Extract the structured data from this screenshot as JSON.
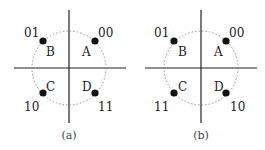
{
  "diagrams": [
    {
      "caption": "(a)",
      "points": [
        {
          "letter": "A",
          "code": "00"
        },
        {
          "letter": "B",
          "code": "01"
        },
        {
          "letter": "C",
          "code": "10"
        },
        {
          "letter": "D",
          "code": "11"
        }
      ]
    },
    {
      "caption": "(b)",
      "points": [
        {
          "letter": "A",
          "code": "00"
        },
        {
          "letter": "B",
          "code": "01"
        },
        {
          "letter": "C",
          "code": "11"
        },
        {
          "letter": "D",
          "code": "10"
        }
      ]
    }
  ],
  "colors": {
    "axis": "#222222",
    "circle": "#888888",
    "point": "#111111"
  }
}
